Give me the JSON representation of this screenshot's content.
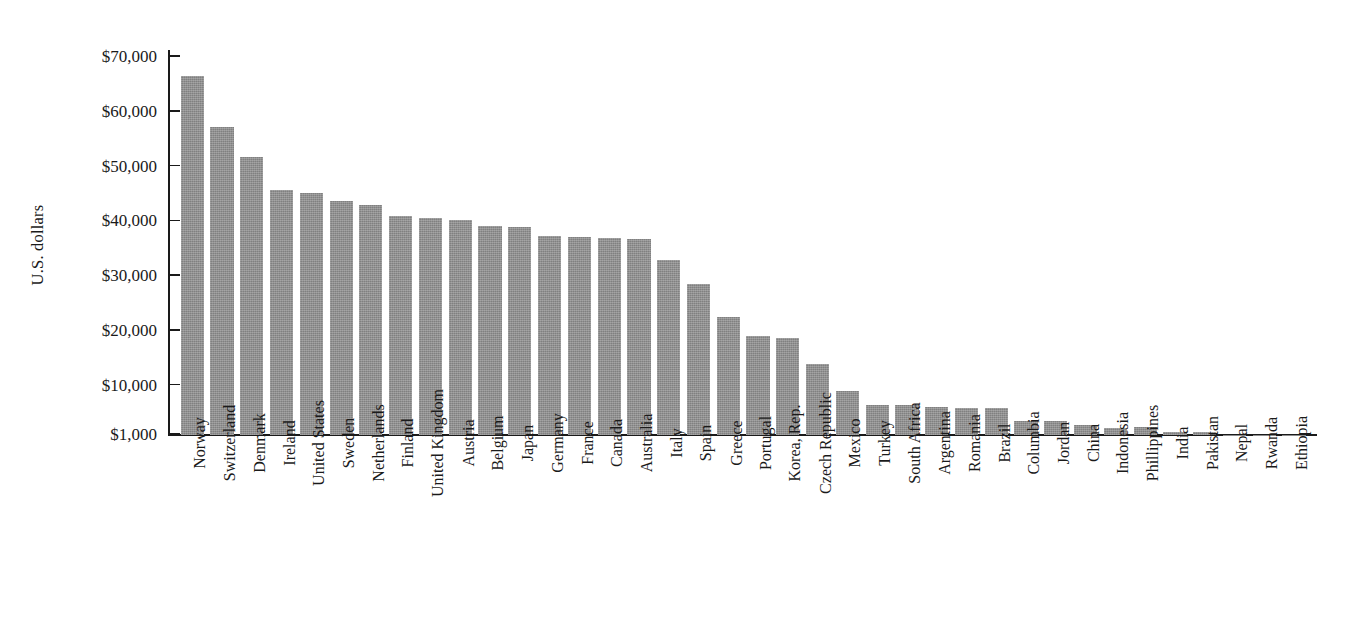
{
  "chart_data": {
    "type": "bar",
    "title": "",
    "subtitle": "",
    "xlabel": "",
    "ylabel": "U.S. dollars",
    "ylim": [
      1000,
      70000
    ],
    "grid": false,
    "legend": null,
    "bar_color": "#8c8c8c",
    "axis_color": "#1a1a1a",
    "y_ticks": [
      {
        "value": 70000,
        "label": "$70,000"
      },
      {
        "value": 60000,
        "label": "$60,000"
      },
      {
        "value": 50000,
        "label": "$50,000"
      },
      {
        "value": 40000,
        "label": "$40,000"
      },
      {
        "value": 30000,
        "label": "$30,000"
      },
      {
        "value": 20000,
        "label": "$20,000"
      },
      {
        "value": 10000,
        "label": "$10,000"
      },
      {
        "value": 1000,
        "label": "$1,000"
      }
    ],
    "categories": [
      "Norway",
      "Switzerland",
      "Denmark",
      "Ireland",
      "United States",
      "Sweden",
      "Netherlands",
      "Finland",
      "United Kingdom",
      "Austria",
      "Belgium",
      "Japan",
      "Germany",
      "France",
      "Canada",
      "Australia",
      "Italy",
      "Spain",
      "Greece",
      "Portugal",
      "Korea, Rep.",
      "Czech Republic",
      "Mexico",
      "Turkey",
      "South Africa",
      "Argentina",
      "Romania",
      "Brazil",
      "Columbia",
      "Jordan",
      "China",
      "Indonesia",
      "Phillippines",
      "India",
      "Pakistan",
      "Nepal",
      "Rwanda",
      "Ethiopia"
    ],
    "values": [
      66500,
      57200,
      51700,
      45700,
      45200,
      43800,
      42900,
      41000,
      40600,
      40200,
      39200,
      39000,
      37300,
      37200,
      37000,
      36800,
      32900,
      28500,
      22600,
      19100,
      18800,
      14000,
      9000,
      6500,
      6500,
      6200,
      6000,
      6000,
      3600,
      3600,
      2900,
      2300,
      2400,
      1600,
      1500,
      1050,
      1040,
      1030
    ]
  }
}
